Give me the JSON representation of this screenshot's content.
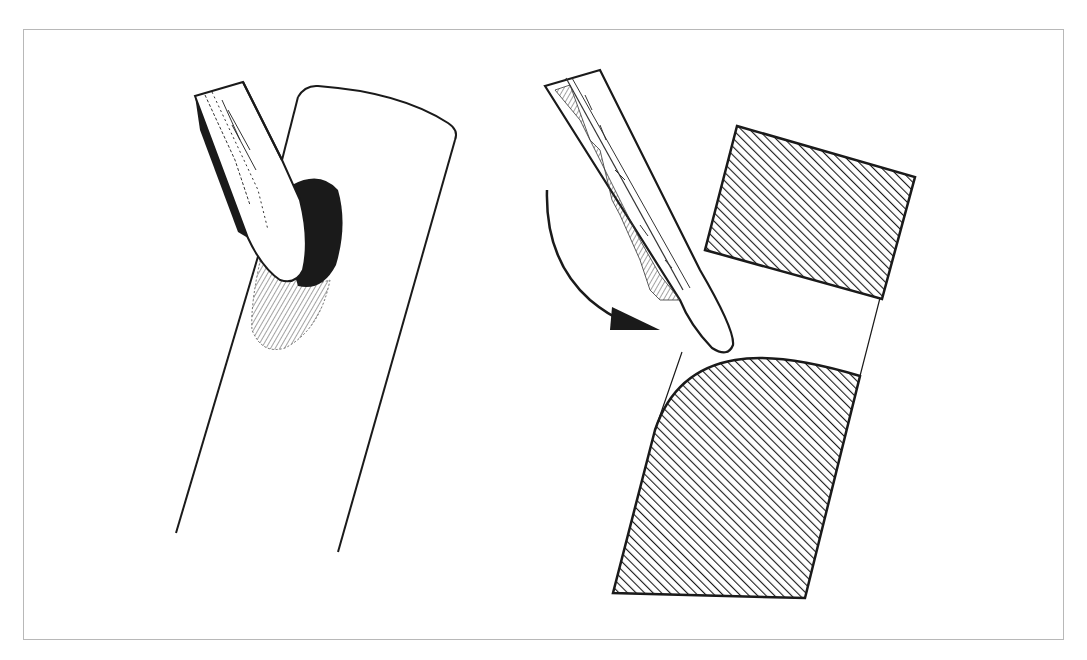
{
  "figure": {
    "caption": "",
    "frame_color": "#b8b8b8",
    "ink_color": "#1a1a1a",
    "left_panel": {
      "label": "chisel-cutting-into-rod",
      "elements": [
        "chisel",
        "rod",
        "cut-notch"
      ]
    },
    "right_panel": {
      "label": "chisel-rotation-cross-section",
      "elements": [
        "chisel",
        "rotation-arrow",
        "upper-hatched-block",
        "lower-hatched-block-rounded-edge"
      ]
    }
  }
}
